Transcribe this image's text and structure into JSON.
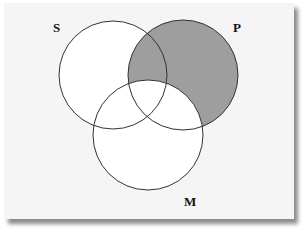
{
  "diagram": {
    "type": "venn-3",
    "sets": [
      {
        "id": "S",
        "label": "S",
        "cx": 113,
        "cy": 75,
        "r": 54
      },
      {
        "id": "P",
        "label": "P",
        "cx": 183,
        "cy": 75,
        "r": 55
      },
      {
        "id": "M",
        "label": "M",
        "cx": 148,
        "cy": 135,
        "r": 55
      }
    ],
    "shaded_region": "P minus M",
    "colors": {
      "background": "#f5f5f5",
      "circle_fill": "#ffffff",
      "shaded": "#9e9e9e",
      "stroke": "#333333"
    }
  }
}
